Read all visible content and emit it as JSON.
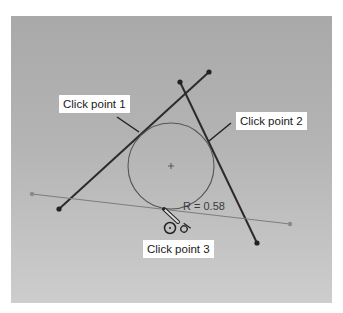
{
  "figure": {
    "callouts": [
      {
        "id": "cp1",
        "label": "Click point 1"
      },
      {
        "id": "cp2",
        "label": "Click point 2"
      },
      {
        "id": "cp3",
        "label": "Click point 3"
      }
    ],
    "dimension": {
      "radius_label": "R = 0.58"
    },
    "icons": [
      {
        "name": "tangent-cursor-icon",
        "glyph": "⊙"
      },
      {
        "name": "tangent-constraint-icon",
        "glyph": "ơ"
      }
    ],
    "colors": {
      "background": "#b4b4b4",
      "line_dark": "#2b2b2b",
      "line_light": "#7a7a7a",
      "circle": "#555555",
      "callout_bg": "#ffffff"
    }
  }
}
